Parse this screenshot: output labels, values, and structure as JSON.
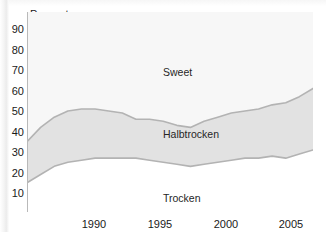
{
  "chart_data": {
    "type": "area",
    "stacked": true,
    "title": "",
    "subtitle": "",
    "xlabel": "",
    "ylabel": "Percent",
    "ylim": [
      0,
      95
    ],
    "xlim": [
      1986,
      2007
    ],
    "grid": true,
    "legend_position": "inline-labels",
    "y_ticks": [
      90,
      80,
      70,
      60,
      50,
      40,
      30,
      20,
      10
    ],
    "x_ticks": [
      1990,
      1995,
      2000,
      2005
    ],
    "x": [
      1986,
      1987,
      1988,
      1989,
      1990,
      1991,
      1992,
      1993,
      1994,
      1995,
      1996,
      1997,
      1998,
      1999,
      2000,
      2001,
      2002,
      2003,
      2004,
      2005,
      2006,
      2007
    ],
    "series": [
      {
        "name": "Trocken",
        "color": "#ffffff",
        "line_color": "#b3b3b3",
        "values": [
          15,
          19,
          23,
          25,
          26,
          27,
          27,
          27,
          27,
          26,
          25,
          24,
          23,
          24,
          25,
          26,
          27,
          27,
          28,
          27,
          29,
          31
        ]
      },
      {
        "name": "Halbtrocken",
        "color": "#e2e2e2",
        "line_color": "#b3b3b3",
        "values": [
          20,
          23,
          24,
          25,
          25,
          24,
          23,
          22,
          19,
          20,
          20,
          19,
          19,
          21,
          22,
          23,
          23,
          24,
          25,
          27,
          28,
          30
        ]
      },
      {
        "name": "Sweet",
        "color": "#f7f7f7",
        "line_color": "#b3b3b3",
        "values": [
          65,
          58,
          53,
          50,
          49,
          49,
          50,
          51,
          54,
          54,
          55,
          57,
          58,
          55,
          53,
          51,
          50,
          49,
          47,
          46,
          43,
          39
        ]
      }
    ],
    "cumulative_upper_boundaries": {
      "trocken_top": [
        15,
        19,
        23,
        25,
        26,
        27,
        27,
        27,
        27,
        26,
        25,
        24,
        23,
        24,
        25,
        26,
        27,
        27,
        28,
        27,
        29,
        31
      ],
      "halbtrocken_top": [
        35,
        42,
        47,
        50,
        51,
        51,
        50,
        49,
        46,
        46,
        45,
        43,
        42,
        45,
        47,
        49,
        50,
        51,
        53,
        54,
        57,
        61
      ]
    },
    "annotations": [
      {
        "text": "Sweet",
        "x": 1996,
        "y": 72
      },
      {
        "text": "Halbtrocken",
        "x": 1996,
        "y": 41
      },
      {
        "text": "Trocken",
        "x": 1996,
        "y": 13
      }
    ]
  },
  "axis": {
    "y_title": "Percent",
    "y_tick_labels": [
      "90",
      "80",
      "70",
      "60",
      "50",
      "40",
      "30",
      "20",
      "10"
    ],
    "x_tick_labels": [
      "1990",
      "1995",
      "2000",
      "2005"
    ]
  },
  "labels": {
    "sweet": "Sweet",
    "halbtrocken": "Halbtrocken",
    "trocken": "Trocken"
  },
  "colors": {
    "band_middle": "#e2e2e2",
    "band_top": "#f7f7f7",
    "band_bottom": "#ffffff",
    "line": "#b3b3b3",
    "grid": "#dcdcdc",
    "axis": "#b9b9b9",
    "text": "#1a1a1a"
  }
}
